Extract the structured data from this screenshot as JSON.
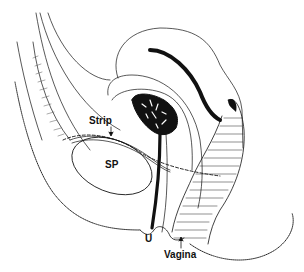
{
  "diagram": {
    "type": "anatomical-line-drawing",
    "colors": {
      "ink": "#111111",
      "background": "#ffffff"
    },
    "labels": {
      "strip": "Strip",
      "sp": "SP",
      "u": "U",
      "vagina": "Vagina"
    },
    "annotations": [
      {
        "label": "Strip",
        "pointer": "down-arrow"
      },
      {
        "label": "Vagina",
        "pointer": "up-arrow"
      }
    ]
  }
}
